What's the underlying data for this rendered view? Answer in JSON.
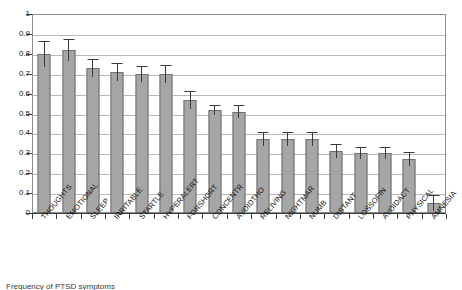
{
  "chart_data": {
    "type": "bar",
    "title": "",
    "xlabel": "",
    "ylabel": "",
    "ylim": [
      0,
      1
    ],
    "grid": true,
    "legend": "none",
    "ytick_labels": [
      "1",
      "0.9",
      "0.8",
      "0.7",
      "0.6",
      "0.5",
      "0.4",
      "0.3",
      "0.2",
      "0.1",
      "0"
    ],
    "ytick_values": [
      1,
      0.9,
      0.8,
      0.7,
      0.6,
      0.5,
      0.4,
      0.3,
      0.2,
      0.1,
      0
    ],
    "categories": [
      "THOUGHTS",
      "EMOTIONAL",
      "SLEEP",
      "IRRITABLE",
      "STARTLE",
      "HYPERALERT",
      "FORSHORT",
      "CONCENTR",
      "AVOIDTHO",
      "RELIVING",
      "NIGHTMAR",
      "NUMB",
      "DISTANT",
      "LOSSOFIN",
      "AVOIDACT",
      "PHYSICAL",
      "AMNESIA"
    ],
    "values": [
      0.8,
      0.82,
      0.73,
      0.71,
      0.7,
      0.7,
      0.57,
      0.52,
      0.51,
      0.37,
      0.37,
      0.37,
      0.31,
      0.3,
      0.3,
      0.27,
      0.05
    ],
    "errors": [
      0.065,
      0.055,
      0.045,
      0.045,
      0.04,
      0.045,
      0.045,
      0.025,
      0.035,
      0.035,
      0.035,
      0.035,
      0.035,
      0.03,
      0.03,
      0.035,
      0.04
    ],
    "error_upper": [
      0.865,
      0.875,
      0.775,
      0.755,
      0.74,
      0.745,
      0.615,
      0.545,
      0.545,
      0.405,
      0.405,
      0.405,
      0.345,
      0.33,
      0.33,
      0.305,
      0.09
    ],
    "bar_color": "#a6a6a6",
    "bar_edge_color": "#707070",
    "error_bar_color": "#3a3a3a",
    "gridline_color": "#b9b9b9",
    "axis_color": "#3c3c3c"
  },
  "caption": {
    "text": "Frequency of PTSD symptoms",
    "visible_note": "cut off at bottom edge of image"
  }
}
